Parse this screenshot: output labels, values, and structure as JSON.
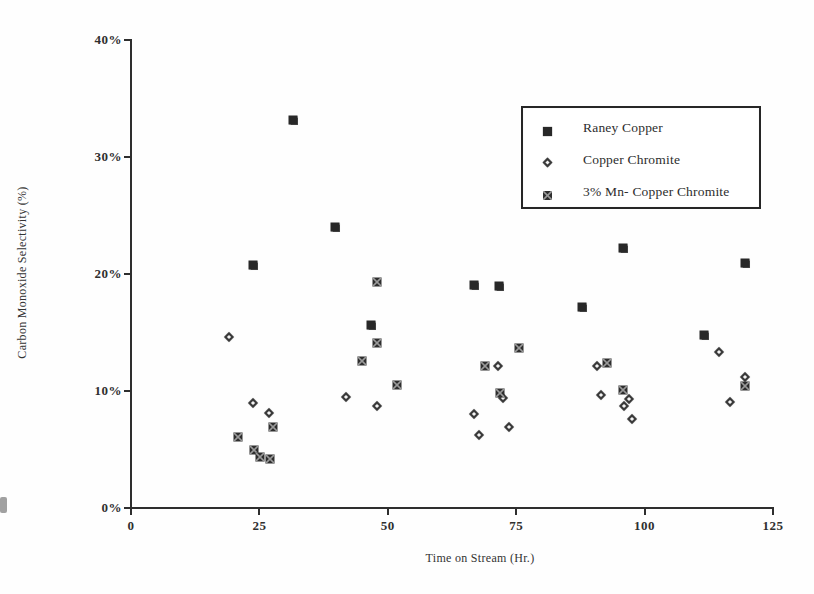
{
  "page": {
    "background": "#ffffff",
    "ink_color": "#2b2b2b"
  },
  "chart_data": {
    "type": "scatter",
    "title": "",
    "xlabel": "Time on Stream (Hr.)",
    "ylabel": "Carbon Monoxide Selectivity (%)",
    "xlim": [
      0,
      125
    ],
    "ylim": [
      0,
      40
    ],
    "x_ticks": [
      {
        "value": 0,
        "label": "0"
      },
      {
        "value": 25,
        "label": "25"
      },
      {
        "value": 50,
        "label": "50"
      },
      {
        "value": 75,
        "label": "75"
      },
      {
        "value": 100,
        "label": "100"
      },
      {
        "value": 125,
        "label": "125"
      }
    ],
    "y_ticks": [
      {
        "value": 0,
        "label": "0%"
      },
      {
        "value": 10,
        "label": "10%"
      },
      {
        "value": 20,
        "label": "20%"
      },
      {
        "value": 30,
        "label": "30%"
      },
      {
        "value": 40,
        "label": "40%"
      }
    ],
    "grid": false,
    "legend_position": "top-right",
    "series": [
      {
        "name": "Raney Copper",
        "marker": "filled-square",
        "color": "#282828",
        "points": [
          [
            23.7,
            20.8
          ],
          [
            31.6,
            33.2
          ],
          [
            39.7,
            24.0
          ],
          [
            46.7,
            15.6
          ],
          [
            66.8,
            19.1
          ],
          [
            71.7,
            19.0
          ],
          [
            87.9,
            17.2
          ],
          [
            95.7,
            22.2
          ],
          [
            111.6,
            14.8
          ],
          [
            119.5,
            20.9
          ]
        ]
      },
      {
        "name": "Copper Chromite",
        "marker": "open-diamond",
        "color": "#3a3a3a",
        "points": [
          [
            19.1,
            14.6
          ],
          [
            23.8,
            9.0
          ],
          [
            26.9,
            8.1
          ],
          [
            41.9,
            9.5
          ],
          [
            47.8,
            8.7
          ],
          [
            66.8,
            8.0
          ],
          [
            67.8,
            6.2
          ],
          [
            71.5,
            12.1
          ],
          [
            72.5,
            9.4
          ],
          [
            73.6,
            6.9
          ],
          [
            90.7,
            12.1
          ],
          [
            91.6,
            9.7
          ],
          [
            96.0,
            8.7
          ],
          [
            96.9,
            9.3
          ],
          [
            97.6,
            7.6
          ],
          [
            114.5,
            13.3
          ],
          [
            116.6,
            9.1
          ],
          [
            119.6,
            11.2
          ]
        ]
      },
      {
        "name": "3% Mn- Copper Chromite",
        "marker": "x-square",
        "color": "#2e2e2e",
        "points": [
          [
            20.9,
            6.1
          ],
          [
            24.0,
            5.0
          ],
          [
            25.2,
            4.4
          ],
          [
            27.1,
            4.2
          ],
          [
            27.6,
            6.9
          ],
          [
            44.9,
            12.6
          ],
          [
            47.8,
            19.3
          ],
          [
            47.8,
            14.1
          ],
          [
            51.7,
            10.5
          ],
          [
            68.9,
            12.1
          ],
          [
            71.8,
            9.8
          ],
          [
            75.5,
            13.7
          ],
          [
            92.6,
            12.4
          ],
          [
            95.7,
            10.1
          ],
          [
            119.6,
            10.4
          ]
        ]
      }
    ]
  }
}
